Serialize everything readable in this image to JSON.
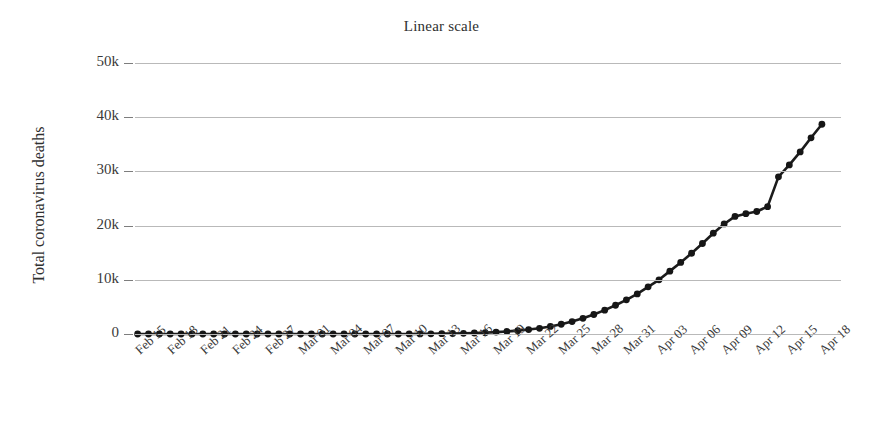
{
  "chart_data": {
    "type": "line",
    "title": "Linear scale",
    "xlabel": "",
    "ylabel": "Total coronavirus deaths",
    "ylim": [
      0,
      50000
    ],
    "xlim": [
      "Feb 15",
      "Apr 18"
    ],
    "grid": true,
    "legend": false,
    "y_tick_labels": [
      "50k",
      "40k",
      "30k",
      "20k",
      "10k",
      "0"
    ],
    "y_tick_values": [
      50000,
      40000,
      30000,
      20000,
      10000,
      0
    ],
    "x_tick_labels": [
      "Feb 15",
      "Feb 18",
      "Feb 21",
      "Feb 24",
      "Feb 27",
      "Mar 01",
      "Mar 04",
      "Mar 07",
      "Mar 10",
      "Mar 13",
      "Mar 16",
      "Mar 19",
      "Mar 22",
      "Mar 25",
      "Mar 28",
      "Mar 31",
      "Apr 03",
      "Apr 06",
      "Apr 09",
      "Apr 12",
      "Apr 15",
      "Apr 18"
    ],
    "marker": "circle",
    "line_color": "#1c1c1c",
    "marker_color": "#161616",
    "grid_color": "#b9b9b9",
    "background_color": "#ffffff",
    "x": [
      "Feb 15",
      "Feb 16",
      "Feb 17",
      "Feb 18",
      "Feb 19",
      "Feb 20",
      "Feb 21",
      "Feb 22",
      "Feb 23",
      "Feb 24",
      "Feb 25",
      "Feb 26",
      "Feb 27",
      "Feb 28",
      "Feb 29",
      "Mar 01",
      "Mar 02",
      "Mar 03",
      "Mar 04",
      "Mar 05",
      "Mar 06",
      "Mar 07",
      "Mar 08",
      "Mar 09",
      "Mar 10",
      "Mar 11",
      "Mar 12",
      "Mar 13",
      "Mar 14",
      "Mar 15",
      "Mar 16",
      "Mar 17",
      "Mar 18",
      "Mar 19",
      "Mar 20",
      "Mar 21",
      "Mar 22",
      "Mar 23",
      "Mar 24",
      "Mar 25",
      "Mar 26",
      "Mar 27",
      "Mar 28",
      "Mar 29",
      "Mar 30",
      "Mar 31",
      "Apr 01",
      "Apr 02",
      "Apr 03",
      "Apr 04",
      "Apr 05",
      "Apr 06",
      "Apr 07",
      "Apr 08",
      "Apr 09",
      "Apr 10",
      "Apr 11",
      "Apr 12",
      "Apr 13",
      "Apr 14",
      "Apr 15",
      "Apr 16",
      "Apr 17",
      "Apr 18"
    ],
    "values": [
      0,
      0,
      0,
      0,
      0,
      0,
      0,
      0,
      0,
      0,
      0,
      0,
      0,
      0,
      0,
      0,
      0,
      0,
      0,
      0,
      0,
      0,
      0,
      0,
      0,
      10,
      20,
      40,
      60,
      90,
      120,
      180,
      250,
      350,
      470,
      620,
      820,
      1050,
      1400,
      1800,
      2300,
      2900,
      3600,
      4400,
      5300,
      6300,
      7400,
      8700,
      10000,
      11600,
      13200,
      14900,
      16700,
      18600,
      20300,
      21700,
      22200,
      22600,
      23500,
      29000,
      31200,
      33600,
      36200,
      38700
    ]
  }
}
